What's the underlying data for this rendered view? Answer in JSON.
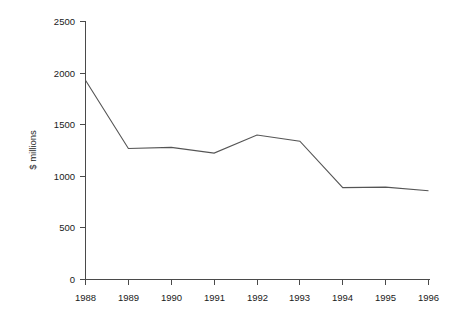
{
  "chart_data": {
    "type": "line",
    "title": "",
    "subtitle": "",
    "xlabel": "",
    "ylabel": "$ millions",
    "categories": [
      "1988",
      "1989",
      "1990",
      "1991",
      "1992",
      "1993",
      "1994",
      "1995",
      "1996"
    ],
    "x": [
      1988,
      1989,
      1990,
      1991,
      1992,
      1993,
      1994,
      1995,
      1996
    ],
    "values": [
      1930,
      1270,
      1280,
      1225,
      1400,
      1340,
      890,
      895,
      860
    ],
    "series": [
      {
        "name": "",
        "values": [
          1930,
          1270,
          1280,
          1225,
          1400,
          1340,
          890,
          895,
          860
        ]
      }
    ],
    "ylim": [
      0,
      2500
    ],
    "yticks": [
      0,
      500,
      1000,
      1500,
      2000,
      2500
    ],
    "ytick_labels": [
      "0",
      "500",
      "1000",
      "1500",
      "2000",
      "2500"
    ],
    "xtick_labels": [
      "1988",
      "1989",
      "1990",
      "1991",
      "1992",
      "1993",
      "1994",
      "1995",
      "1996"
    ],
    "grid": false,
    "legend": false,
    "legend_position": "none",
    "line_color": "#555555",
    "axis_color": "#4a4a4a",
    "background_color": "#ffffff",
    "annotations": []
  },
  "axis": {
    "y_title": "$ millions",
    "y_labels": [
      "2500",
      "2000",
      "1500",
      "1000",
      "500",
      "0"
    ],
    "x_labels": [
      "1988",
      "1989",
      "1990",
      "1991",
      "1992",
      "1993",
      "1994",
      "1995",
      "1996"
    ]
  }
}
